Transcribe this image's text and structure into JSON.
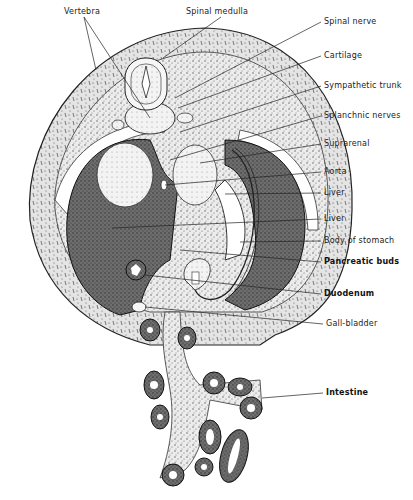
{
  "figure": {
    "type": "anatomical-cross-section",
    "background": "#ffffff",
    "ink": "#222222",
    "labels": [
      {
        "id": "vertebra",
        "text": "Vertebra",
        "x": 64,
        "y": 12,
        "bold": false,
        "targets": [
          [
            96,
            70
          ],
          [
            150,
            118
          ]
        ]
      },
      {
        "id": "spinal-medulla",
        "text": "Spinal medulla",
        "x": 186,
        "y": 12,
        "bold": false,
        "targets": [
          [
            163,
            58
          ]
        ]
      },
      {
        "id": "spinal-nerve",
        "text": "Spinal nerve",
        "x": 324,
        "y": 22,
        "bold": false,
        "targets": [
          [
            175,
            98
          ]
        ]
      },
      {
        "id": "cartilage",
        "text": "Cartilage",
        "x": 324,
        "y": 56,
        "bold": false,
        "targets": [
          [
            178,
            108
          ]
        ]
      },
      {
        "id": "sympathetic-trunk",
        "text": "Sympathetic trunk",
        "x": 324,
        "y": 86,
        "bold": false,
        "targets": [
          [
            180,
            132
          ]
        ]
      },
      {
        "id": "splanchnic-nerves",
        "text": "Splanchnic nerves",
        "x": 324,
        "y": 116,
        "bold": false,
        "targets": [
          [
            170,
            160
          ]
        ]
      },
      {
        "id": "suprarenal",
        "text": "Suprarenal",
        "x": 324,
        "y": 144,
        "bold": false,
        "targets": [
          [
            200,
            163
          ]
        ]
      },
      {
        "id": "aorta",
        "text": "Aorta",
        "x": 324,
        "y": 172,
        "bold": false,
        "targets": [
          [
            165,
            185
          ]
        ]
      },
      {
        "id": "liver-1",
        "text": "Liver",
        "x": 324,
        "y": 193,
        "bold": false,
        "targets": [
          [
            225,
            194
          ]
        ]
      },
      {
        "id": "liver-2",
        "text": "Liver",
        "x": 324,
        "y": 219,
        "bold": false,
        "targets": [
          [
            112,
            228
          ]
        ]
      },
      {
        "id": "body-of-stomach",
        "text": "Body of stomach",
        "x": 324,
        "y": 241,
        "bold": false,
        "targets": [
          [
            240,
            242
          ]
        ]
      },
      {
        "id": "pancreatic-buds",
        "text": "Pancreatic buds",
        "x": 324,
        "y": 262,
        "bold": true,
        "targets": [
          [
            180,
            250
          ]
        ]
      },
      {
        "id": "duodenum",
        "text": "Duodenum",
        "x": 324,
        "y": 294,
        "bold": true,
        "targets": [
          [
            145,
            275
          ]
        ]
      },
      {
        "id": "gall-bladder",
        "text": "Gall-bladder",
        "x": 326,
        "y": 324,
        "bold": false,
        "targets": [
          [
            145,
            307
          ]
        ]
      },
      {
        "id": "intestine",
        "text": "Intestine",
        "x": 326,
        "y": 393,
        "bold": true,
        "targets": [
          [
            262,
            398
          ]
        ]
      }
    ]
  }
}
